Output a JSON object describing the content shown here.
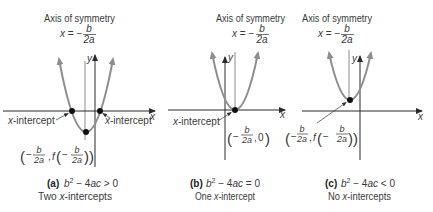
{
  "figure": {
    "panels": [
      {
        "axis_title": "Axis of symmetry",
        "axis_eq": {
          "lhs": "x",
          "eq": " = −",
          "num": "b",
          "den": "2a"
        },
        "x_axis_label": "x",
        "y_axis_label": "y",
        "intercept_left": {
          "x": "x",
          "text": "-intercept"
        },
        "intercept_right": {
          "x": "x",
          "text": "-intercept"
        },
        "vertex": {
          "open": "(",
          "neg1": "−",
          "num1": "b",
          "den1": "2a",
          "sep": ",",
          "f": "f",
          "open2": "(",
          "neg2": "−",
          "num2": "b",
          "den2": "2a",
          "close": "))"
        },
        "caption": {
          "letter": "(a)",
          "b": "b",
          "exp": "2",
          "mid": " − 4",
          "ac": "ac",
          "rel": " > 0"
        },
        "result": {
          "pre": "Two ",
          "x": "x",
          "post": "-intercepts"
        }
      },
      {
        "axis_title": "Axis of symmetry",
        "axis_eq": {
          "lhs": "x",
          "eq": " = −",
          "num": "b",
          "den": "2a"
        },
        "x_axis_label": "x",
        "y_axis_label": "y",
        "intercept_left": {
          "x": "x",
          "text": "-intercept"
        },
        "vertex": {
          "open": "(",
          "neg": "−",
          "num": "b",
          "den": "2a",
          "sep": ",",
          "val": "0",
          "close": ")"
        },
        "caption": {
          "letter": "(b)",
          "b": "b",
          "exp": "2",
          "mid": " − 4",
          "ac": "ac",
          "rel": " = 0"
        },
        "result": {
          "pre": "One ",
          "x": "x",
          "post": "-intercept"
        }
      },
      {
        "axis_title": "Axis of symmetry",
        "axis_eq": {
          "lhs": "x",
          "eq": " = −",
          "num": "b",
          "den": "2a"
        },
        "x_axis_label": "x",
        "y_axis_label": "y",
        "vertex": {
          "open": "(",
          "neg1": "−",
          "num1": "b",
          "den1": "2a",
          "sep": ",",
          "f": "f",
          "open2": "(",
          "neg2": "−",
          "num2": "b",
          "den2": "2a",
          "close": "))"
        },
        "caption": {
          "letter": "(c)",
          "b": "b",
          "exp": "2",
          "mid": " − 4",
          "ac": "ac",
          "rel": " < 0"
        },
        "result": {
          "pre": "No ",
          "x": "x",
          "post": "-intercepts"
        }
      }
    ]
  },
  "colors": {
    "curve": "#8e8e8e",
    "axis": "#2b2b2b",
    "symmetry_line": "#6e6e6e",
    "point": "#111111",
    "text": "#3a3a3a"
  }
}
